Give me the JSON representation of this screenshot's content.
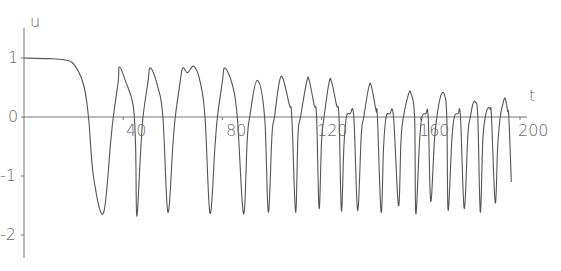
{
  "chart_data": {
    "type": "line",
    "title": "",
    "xlabel": "t",
    "ylabel": "u",
    "xlim": [
      0,
      200
    ],
    "ylim": [
      -2.3,
      1.5
    ],
    "grid": false,
    "legend": null,
    "x_ticks": [
      40,
      80,
      120,
      160,
      200
    ],
    "x_tick_labels": [
      "40",
      "80",
      "120",
      "160",
      "200"
    ],
    "y_ticks": [
      1,
      0,
      -1,
      -2
    ],
    "y_tick_labels": [
      "1",
      "0",
      "-1",
      "-2"
    ],
    "line_color": "#555555",
    "series": [
      {
        "name": "u(t)",
        "points": [
          [
            0,
            1.0
          ],
          [
            10,
            0.99
          ],
          [
            16,
            0.97
          ],
          [
            20,
            0.9
          ],
          [
            24,
            0.55
          ],
          [
            26,
            0.0
          ],
          [
            28,
            -1.0
          ],
          [
            32,
            -1.63
          ],
          [
            35,
            -0.4
          ],
          [
            36,
            0.0
          ],
          [
            38,
            0.6
          ],
          [
            38.5,
            0.85
          ],
          [
            41,
            0.6
          ],
          [
            44,
            0.2
          ],
          [
            45,
            -0.5
          ],
          [
            45.5,
            -1.68
          ],
          [
            47,
            -0.6
          ],
          [
            48,
            0.0
          ],
          [
            50,
            0.6
          ],
          [
            51,
            0.83
          ],
          [
            54,
            0.5
          ],
          [
            56,
            0.0
          ],
          [
            58,
            -1.61
          ],
          [
            60,
            -0.5
          ],
          [
            61,
            0.0
          ],
          [
            63,
            0.6
          ],
          [
            64,
            0.83
          ],
          [
            66,
            0.75
          ],
          [
            68.5,
            0.86
          ],
          [
            71,
            0.6
          ],
          [
            73,
            0.0
          ],
          [
            75,
            -1.63
          ],
          [
            77,
            -0.5
          ],
          [
            78,
            0.0
          ],
          [
            80,
            0.6
          ],
          [
            81,
            0.83
          ],
          [
            84,
            0.55
          ],
          [
            86,
            0.0
          ],
          [
            88.5,
            -1.64
          ],
          [
            90,
            -0.4
          ],
          [
            91,
            0.0
          ],
          [
            94,
            0.62
          ],
          [
            97,
            0.0
          ],
          [
            98.5,
            -1.61
          ],
          [
            100,
            -0.3
          ],
          [
            101,
            0.0
          ],
          [
            103,
            0.6
          ],
          [
            104.5,
            0.64
          ],
          [
            107,
            0.2
          ],
          [
            108,
            0.0
          ],
          [
            109.5,
            -1.61
          ],
          [
            110.5,
            -0.3
          ],
          [
            111.5,
            0.0
          ],
          [
            114,
            0.6
          ],
          [
            115,
            0.62
          ],
          [
            117,
            0.2
          ],
          [
            118,
            0.0
          ],
          [
            119,
            -1.55
          ],
          [
            120,
            -0.4
          ],
          [
            121,
            0.0
          ],
          [
            123,
            0.58
          ],
          [
            124,
            0.6
          ],
          [
            126,
            0.2
          ],
          [
            127,
            0.0
          ],
          [
            128,
            -1.59
          ],
          [
            129,
            -0.5
          ],
          [
            130,
            0.0
          ],
          [
            131.5,
            0.05
          ],
          [
            133,
            0.0
          ],
          [
            134.5,
            -1.58
          ],
          [
            136,
            -0.3
          ],
          [
            137,
            0.0
          ],
          [
            139,
            0.5
          ],
          [
            140,
            0.53
          ],
          [
            142,
            0.1
          ],
          [
            142.5,
            0.0
          ],
          [
            144,
            -1.61
          ],
          [
            145,
            -0.5
          ],
          [
            146,
            0.0
          ],
          [
            147.5,
            0.05
          ],
          [
            149,
            0.0
          ],
          [
            151,
            -1.5
          ],
          [
            152,
            -0.4
          ],
          [
            153,
            0.0
          ],
          [
            155,
            0.38
          ],
          [
            156,
            0.4
          ],
          [
            157.5,
            0.0
          ],
          [
            158,
            -1.64
          ],
          [
            159.5,
            -0.4
          ],
          [
            160.5,
            0.0
          ],
          [
            162,
            0.05
          ],
          [
            163,
            0.0
          ],
          [
            164,
            -1.43
          ],
          [
            165.5,
            -0.4
          ],
          [
            166.5,
            0.0
          ],
          [
            168,
            0.35
          ],
          [
            169.5,
            0.38
          ],
          [
            170.5,
            0.0
          ],
          [
            171,
            -1.58
          ],
          [
            172.5,
            -0.4
          ],
          [
            173.5,
            0.0
          ],
          [
            175,
            0.05
          ],
          [
            176,
            0.0
          ],
          [
            177.5,
            -1.55
          ],
          [
            179,
            -0.3
          ],
          [
            180,
            0.0
          ],
          [
            181,
            0.22
          ],
          [
            182,
            0.25
          ],
          [
            183,
            0.0
          ],
          [
            184,
            -1.61
          ],
          [
            185,
            -0.4
          ],
          [
            186,
            0.0
          ],
          [
            187,
            0.15
          ],
          [
            188,
            0.13
          ],
          [
            188.5,
            0.0
          ],
          [
            190,
            -1.45
          ],
          [
            191,
            -0.5
          ],
          [
            192,
            0.0
          ],
          [
            193,
            0.2
          ],
          [
            194,
            0.32
          ],
          [
            195,
            0.1
          ],
          [
            195.5,
            0.0
          ],
          [
            196.5,
            -1.1
          ]
        ]
      }
    ]
  },
  "axes": {
    "x_label": "t",
    "y_label": "u",
    "x_ticks": [
      {
        "value": 40,
        "label": "40"
      },
      {
        "value": 80,
        "label": "80"
      },
      {
        "value": 120,
        "label": "120"
      },
      {
        "value": 160,
        "label": "160"
      },
      {
        "value": 200,
        "label": "200"
      }
    ],
    "y_ticks": [
      {
        "value": 1,
        "label": "1"
      },
      {
        "value": 0,
        "label": "0"
      },
      {
        "value": -1,
        "label": "-1"
      },
      {
        "value": -2,
        "label": "-2"
      }
    ]
  }
}
